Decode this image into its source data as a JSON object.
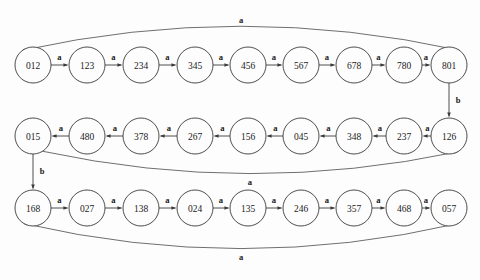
{
  "diagram": {
    "type": "finite-state-automaton",
    "background_color": "#fdfdfd",
    "stroke_color": "#3a3a3a",
    "text_color": "#1a1a1a",
    "alphabet": [
      "a",
      "b"
    ],
    "rows": [
      {
        "id": "row-top",
        "direction": "left-to-right",
        "cy": 65,
        "nodes": [
          {
            "id": "n012",
            "label": "012",
            "cx": 33
          },
          {
            "id": "n123",
            "label": "123",
            "cx": 87
          },
          {
            "id": "n234",
            "label": "234",
            "cx": 141
          },
          {
            "id": "n345",
            "label": "345",
            "cx": 195
          },
          {
            "id": "n456",
            "label": "456",
            "cx": 248
          },
          {
            "id": "n567",
            "label": "567",
            "cx": 301
          },
          {
            "id": "n678",
            "label": "678",
            "cx": 354
          },
          {
            "id": "n780",
            "label": "780",
            "cx": 404
          },
          {
            "id": "n801",
            "label": "801",
            "cx": 449
          }
        ]
      },
      {
        "id": "row-middle",
        "direction": "right-to-left",
        "cy": 136,
        "nodes": [
          {
            "id": "n015",
            "label": "015",
            "cx": 33
          },
          {
            "id": "n480",
            "label": "480",
            "cx": 87
          },
          {
            "id": "n378",
            "label": "378",
            "cx": 141
          },
          {
            "id": "n267",
            "label": "267",
            "cx": 195
          },
          {
            "id": "n156",
            "label": "156",
            "cx": 248
          },
          {
            "id": "n045",
            "label": "045",
            "cx": 301
          },
          {
            "id": "n348",
            "label": "348",
            "cx": 354
          },
          {
            "id": "n237",
            "label": "237",
            "cx": 404
          },
          {
            "id": "n126",
            "label": "126",
            "cx": 449
          }
        ]
      },
      {
        "id": "row-bottom",
        "direction": "left-to-right",
        "cy": 208,
        "nodes": [
          {
            "id": "n168",
            "label": "168",
            "cx": 33
          },
          {
            "id": "n027",
            "label": "027",
            "cx": 87
          },
          {
            "id": "n138",
            "label": "138",
            "cx": 141
          },
          {
            "id": "n024",
            "label": "024",
            "cx": 195
          },
          {
            "id": "n135",
            "label": "135",
            "cx": 248
          },
          {
            "id": "n246",
            "label": "246",
            "cx": 301
          },
          {
            "id": "n357",
            "label": "357",
            "cx": 354
          },
          {
            "id": "n468",
            "label": "468",
            "cx": 404
          },
          {
            "id": "n057",
            "label": "057",
            "cx": 449
          }
        ]
      }
    ],
    "node_radius": 18,
    "straight_edges": [
      {
        "from": "012",
        "to": "123",
        "label": "a"
      },
      {
        "from": "123",
        "to": "234",
        "label": "a"
      },
      {
        "from": "234",
        "to": "345",
        "label": "a"
      },
      {
        "from": "345",
        "to": "456",
        "label": "a"
      },
      {
        "from": "456",
        "to": "567",
        "label": "a"
      },
      {
        "from": "567",
        "to": "678",
        "label": "a"
      },
      {
        "from": "678",
        "to": "780",
        "label": "a"
      },
      {
        "from": "780",
        "to": "801",
        "label": "a"
      },
      {
        "from": "126",
        "to": "237",
        "label": "a"
      },
      {
        "from": "237",
        "to": "348",
        "label": "a"
      },
      {
        "from": "348",
        "to": "045",
        "label": "a"
      },
      {
        "from": "045",
        "to": "156",
        "label": "a"
      },
      {
        "from": "156",
        "to": "267",
        "label": "a"
      },
      {
        "from": "267",
        "to": "378",
        "label": "a"
      },
      {
        "from": "378",
        "to": "480",
        "label": "a"
      },
      {
        "from": "480",
        "to": "015",
        "label": "a"
      },
      {
        "from": "168",
        "to": "027",
        "label": "a"
      },
      {
        "from": "027",
        "to": "138",
        "label": "a"
      },
      {
        "from": "138",
        "to": "024",
        "label": "a"
      },
      {
        "from": "024",
        "to": "135",
        "label": "a"
      },
      {
        "from": "135",
        "to": "246",
        "label": "a"
      },
      {
        "from": "246",
        "to": "357",
        "label": "a"
      },
      {
        "from": "357",
        "to": "468",
        "label": "a"
      },
      {
        "from": "468",
        "to": "057",
        "label": "a"
      }
    ],
    "vertical_edges": [
      {
        "from": "801",
        "to": "126",
        "label": "b"
      },
      {
        "from": "015",
        "to": "168",
        "label": "b"
      }
    ],
    "curved_edges": [
      {
        "from": "801",
        "to": "012",
        "label": "a",
        "arc": "above-top-row"
      },
      {
        "from": "015",
        "to": "126",
        "label": "a",
        "arc": "below-middle-row"
      },
      {
        "from": "057",
        "to": "168",
        "label": "a",
        "arc": "below-bottom-row"
      }
    ]
  }
}
